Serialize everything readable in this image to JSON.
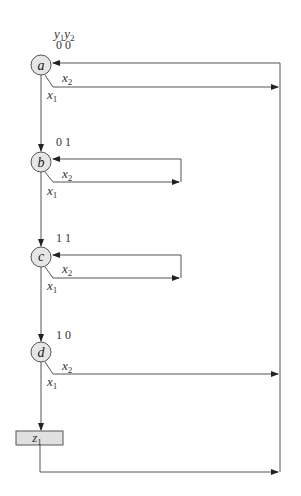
{
  "diagram": {
    "type": "ASM chart / state flow",
    "header": {
      "var1": "y",
      "var1_sub": "1",
      "var2": "y",
      "var2_sub": "2"
    },
    "states": [
      {
        "name": "a",
        "code": "0 0",
        "cx": 41,
        "cy": 65
      },
      {
        "name": "b",
        "code": "0 1",
        "cx": 41,
        "cy": 162
      },
      {
        "name": "c",
        "code": "1 1",
        "cx": 41,
        "cy": 257
      },
      {
        "name": "d",
        "code": "1 0",
        "cx": 41,
        "cy": 352
      }
    ],
    "branch_labels": {
      "x2": {
        "var": "x",
        "sub": "2"
      },
      "x1": {
        "var": "x",
        "sub": "1"
      }
    },
    "output": {
      "var": "z",
      "sub": "1"
    },
    "colors": {
      "line": "#555555",
      "state_fill": "#e6e6e6",
      "output_fill": "#e0e0e0"
    }
  }
}
